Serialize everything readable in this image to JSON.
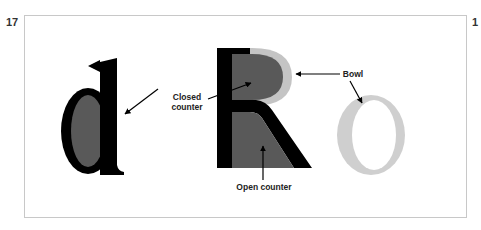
{
  "page": {
    "number_left": "17",
    "number_right": "1"
  },
  "figure": {
    "letters": [
      {
        "char": "d",
        "stroke_color": "#000000",
        "counter_color": "#595959",
        "highlight": "closed counter"
      },
      {
        "char": "R",
        "stroke_color": "#000000",
        "counter_color": "#595959",
        "bowl_color": "#c4c4c4",
        "highlight": "bowl, closed counter, open counter"
      },
      {
        "char": "O",
        "stroke_color": "#cfcfcf",
        "highlight": "bowl"
      }
    ],
    "labels": {
      "closed_counter_line1": "Closed",
      "closed_counter_line2": "counter",
      "bowl": "Bowl",
      "open_counter": "Open counter"
    },
    "colors": {
      "black": "#000000",
      "dark_gray": "#595959",
      "light_gray": "#c4c4c4",
      "frame_border": "#c8c8c8"
    }
  }
}
